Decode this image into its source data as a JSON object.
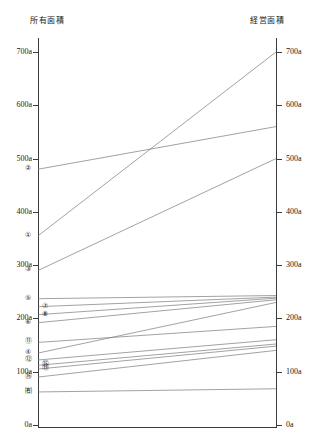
{
  "axes": {
    "left": {
      "title": "所有面積",
      "ticks": [
        "700a",
        "600a",
        "500a",
        "400a",
        "300a",
        "200a",
        "100a",
        "0a"
      ],
      "tick_values": [
        700,
        600,
        500,
        400,
        300,
        200,
        100,
        0
      ]
    },
    "right": {
      "title": "経営面積",
      "ticks": [
        "700a",
        "600a",
        "500a",
        "400a",
        "300a",
        "200a",
        "100a",
        "0a"
      ],
      "tick_values": [
        700,
        600,
        500,
        400,
        300,
        200,
        100,
        0
      ]
    }
  },
  "chart_data": {
    "type": "line",
    "title": "",
    "subtitle": "",
    "xlabel": "",
    "ylabel": "",
    "x": [
      "所有面積",
      "経営面積"
    ],
    "categories": [
      "所有面積",
      "経営面積"
    ],
    "ylim": [
      0,
      700
    ],
    "grid": false,
    "legend_position": "none",
    "axis_unit": "a",
    "series": [
      {
        "name": "①",
        "label": "①",
        "values": [
          355,
          700
        ]
      },
      {
        "name": "②",
        "label": "②",
        "values": [
          480,
          560
        ]
      },
      {
        "name": "③",
        "label": "③",
        "values": [
          290,
          500
        ]
      },
      {
        "name": "④",
        "label": "④",
        "values": [
          135,
          230
        ]
      },
      {
        "name": "⑤",
        "label": "⑤",
        "values": [
          237,
          243
        ]
      },
      {
        "name": "⑥",
        "label": "⑥",
        "values": [
          192,
          235
        ]
      },
      {
        "name": "⑦",
        "label": "⑦",
        "values": [
          222,
          240
        ]
      },
      {
        "name": "⑧",
        "label": "⑧",
        "values": [
          207,
          238
        ]
      },
      {
        "name": "⑪",
        "label": "⑪",
        "values": [
          155,
          185
        ]
      },
      {
        "name": "⑫",
        "label": "⑫",
        "values": [
          122,
          160
        ]
      },
      {
        "name": "⑬",
        "label": "⑬",
        "values": [
          105,
          148
        ]
      },
      {
        "name": "⑮",
        "label": "⑮",
        "values": [
          112,
          152
        ]
      },
      {
        "name": "⑯",
        "label": "⑯",
        "values": [
          90,
          140
        ]
      },
      {
        "name": "㉓",
        "label": "㈲",
        "values": [
          62,
          68
        ]
      }
    ],
    "left_axis_labels": [
      {
        "label": "②",
        "value": 480
      },
      {
        "label": "①",
        "value": 355
      },
      {
        "label": "③",
        "value": 290
      },
      {
        "label": "⑤",
        "value": 237
      },
      {
        "label": "⑦",
        "value": 222
      },
      {
        "label": "⑧",
        "value": 207
      },
      {
        "label": "⑥",
        "value": 192
      },
      {
        "label": "⑪",
        "value": 155
      },
      {
        "label": "④",
        "value": 135
      },
      {
        "label": "⑫",
        "value": 122
      },
      {
        "label": "⑮",
        "value": 112
      },
      {
        "label": "⑬",
        "value": 105
      },
      {
        "label": "⑯",
        "value": 90
      },
      {
        "label": "㈲",
        "value": 62
      }
    ]
  }
}
